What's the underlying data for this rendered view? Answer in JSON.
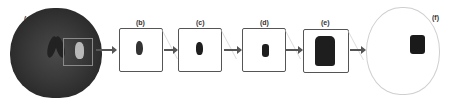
{
  "figure": {
    "panels": [
      {
        "id": "a",
        "label": "(a)",
        "description": "Brain CT slice with region of interest box"
      },
      {
        "id": "b",
        "label": "(b)",
        "description": "Cropped lesion region"
      },
      {
        "id": "c",
        "label": "(c)",
        "description": "Segmented lesion"
      },
      {
        "id": "d",
        "label": "(d)",
        "description": "Refined lesion mask"
      },
      {
        "id": "e",
        "label": "(e)",
        "description": "Enlarged lesion mask"
      },
      {
        "id": "f",
        "label": "(f)",
        "description": "Lesion mask on head outline"
      }
    ],
    "colors": {
      "brain_dark": "#2a2a2a",
      "lesion_dark": "#1e1e1e",
      "roi_lesion": "#b9b9b9",
      "box_border": "#555555",
      "head_outline": "#cfcfcf"
    }
  }
}
